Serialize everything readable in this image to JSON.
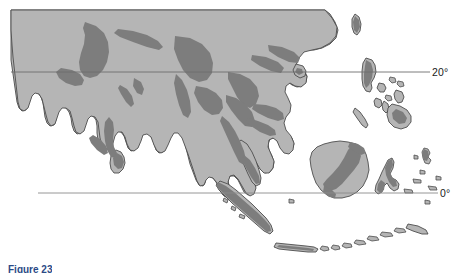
{
  "figure": {
    "caption": "Figure 23",
    "kind": "thematic-map",
    "region": "South and Southeast Asia"
  },
  "map": {
    "background_color": "#ffffff",
    "land_color": "#b5b5b5",
    "highland_color": "#7d7d7d",
    "outline_color": "#4d4d4d",
    "graticule_color": "#8a8a8a",
    "latitude_lines": [
      {
        "id": "lat-20n",
        "label": "20°",
        "y_px": 72,
        "x_start_px": 11,
        "x_end_px": 430
      },
      {
        "id": "lat-0",
        "label": "0°",
        "y_px": 193,
        "x_start_px": 38,
        "x_end_px": 438
      }
    ],
    "legend_values": {
      "land": "lowland",
      "highland": "upland / mountain"
    },
    "landmasses": [
      "Asian mainland",
      "Indian subcontinent",
      "Sri Lanka",
      "Indochina peninsula",
      "Malay Peninsula",
      "Hainan",
      "Taiwan",
      "Luzon",
      "Mindoro",
      "Panay",
      "Negros",
      "Samar",
      "Palawan",
      "Mindanao",
      "Borneo",
      "Sulawesi",
      "Sumatra",
      "Java",
      "Bali",
      "Lesser Sunda Islands",
      "Halmahera"
    ]
  }
}
